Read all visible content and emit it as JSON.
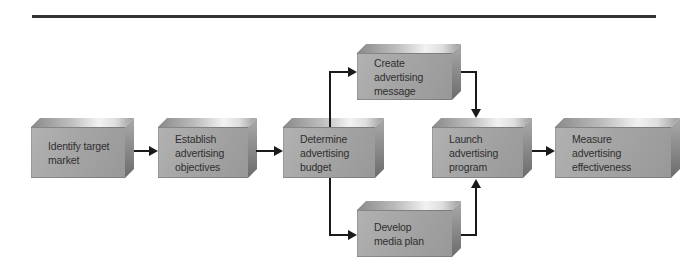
{
  "colors": {
    "bg": "#ffffff",
    "rule": "#333333",
    "arrow": "#1a1a1a",
    "text": "#2f2f2f",
    "box-front-gray": "#a7a7a7",
    "box-top-highlight": "#f2f2f2",
    "box-side-dark": "#6e6e6e"
  },
  "diagram": {
    "type": "flowchart",
    "nodes": [
      {
        "id": "identify-target-market",
        "label": "Identify target market",
        "lines": [
          "Identify target",
          "market"
        ]
      },
      {
        "id": "establish-advertising-objectives",
        "label": "Establish advertising objectives",
        "lines": [
          "Establish",
          "advertising",
          "objectives"
        ]
      },
      {
        "id": "determine-advertising-budget",
        "label": "Determine advertising budget",
        "lines": [
          "Determine",
          "advertising",
          "budget"
        ]
      },
      {
        "id": "create-advertising-message",
        "label": "Create advertising message",
        "lines": [
          "Create",
          "advertising",
          "message"
        ]
      },
      {
        "id": "develop-media-plan",
        "label": "Develop media plan",
        "lines": [
          "Develop",
          "media plan"
        ]
      },
      {
        "id": "launch-advertising-program",
        "label": "Launch advertising program",
        "lines": [
          "Launch",
          "advertising",
          "program"
        ]
      },
      {
        "id": "measure-advertising-effectiveness",
        "label": "Measure advertising effectiveness",
        "lines": [
          "Measure",
          "advertising",
          "effectiveness"
        ]
      }
    ],
    "edges": [
      {
        "from": "identify-target-market",
        "to": "establish-advertising-objectives"
      },
      {
        "from": "establish-advertising-objectives",
        "to": "determine-advertising-budget"
      },
      {
        "from": "determine-advertising-budget",
        "to": "create-advertising-message"
      },
      {
        "from": "determine-advertising-budget",
        "to": "develop-media-plan"
      },
      {
        "from": "create-advertising-message",
        "to": "launch-advertising-program"
      },
      {
        "from": "develop-media-plan",
        "to": "launch-advertising-program"
      },
      {
        "from": "launch-advertising-program",
        "to": "measure-advertising-effectiveness"
      }
    ]
  }
}
